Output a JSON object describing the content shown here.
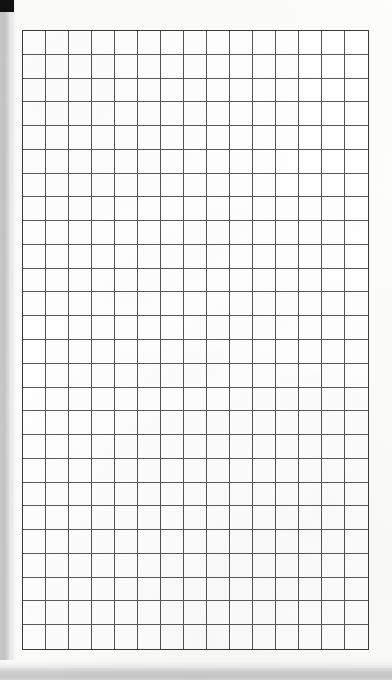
{
  "document": {
    "kind": "scanned-grid-paper",
    "title": "Blank quadrille grid page",
    "page_width_px": 392,
    "page_height_px": 680
  },
  "marks": {
    "registration_mark_name": "registration-square",
    "watermark_text": ""
  },
  "colors": {
    "page_background": "#ffffff",
    "paper": "#fdfdfc",
    "grid_line": "#555555",
    "grid_border": "#3b3b3b",
    "scanner_band": "#c8c8c8",
    "registration_mark": "#111111"
  },
  "chart_data": {
    "type": "table",
    "columns": 15,
    "rows": 26,
    "cell_width_px": 23.1,
    "cell_height_px": 23.8,
    "origin_x_px": 22,
    "origin_y_px": 30,
    "grid_width_px": 347,
    "grid_height_px": 620,
    "grid": true,
    "values": [],
    "xlabel": "",
    "ylabel": ""
  }
}
